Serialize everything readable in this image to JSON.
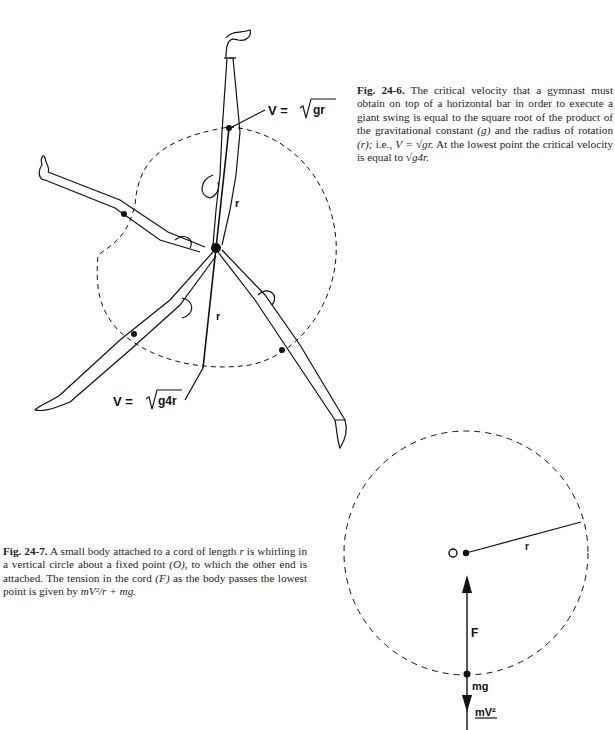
{
  "figure_24_6": {
    "caption": {
      "number": "Fig. 24-6.",
      "text_1": " The critical velocity that a gymnast must obtain on top of a horizontal bar in order to execute a giant swing is equal to the square root of the product of the gravitational constant ",
      "g_symbol": "(g)",
      "text_2": " and the radius of rotation ",
      "r_symbol": "(r);",
      "text_3": " i.e., ",
      "formula_top": "V = √gr.",
      "text_4": " At the lowest point the critical velocity is equal to ",
      "formula_bottom": "√g4r."
    },
    "labels": {
      "top_velocity_prefix": "V =",
      "top_velocity_radicand": "gr",
      "bottom_velocity_prefix": "V =",
      "bottom_velocity_radicand": "g4r",
      "radius_upper": "r",
      "radius_lower": "r"
    }
  },
  "figure_24_7": {
    "caption": {
      "number": "Fig. 24-7.",
      "text_1": " A small body attached to a cord of length ",
      "r_symbol": "r",
      "text_2": " is whirling in a vertical circle about a fixed point ",
      "o_symbol": "(O),",
      "text_3": " to which the other end is attached. The tension in the cord ",
      "f_symbol": "(F)",
      "text_4": " as the body passes the lowest point is given by ",
      "formula": "mV²/r + mg."
    },
    "labels": {
      "center": "O",
      "radius": "r",
      "tension": "F",
      "weight": "mg",
      "centripetal_numerator": "mV²"
    }
  }
}
